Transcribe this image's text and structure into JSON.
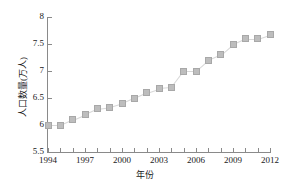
{
  "chart_data": {
    "type": "line",
    "title": "",
    "xlabel": "年份",
    "ylabel": "人口数量(万人)",
    "xlim": [
      1994,
      2012
    ],
    "ylim": [
      5.5,
      8
    ],
    "yticks": [
      5.5,
      6,
      6.5,
      7,
      7.5,
      8
    ],
    "ytick_labels": [
      "5.5",
      "6",
      "6.5",
      "7",
      "7.5",
      "8"
    ],
    "xticks": [
      1994,
      1997,
      2000,
      2003,
      2006,
      2009,
      2012
    ],
    "xtick_labels": [
      "1994",
      "1997",
      "2000",
      "2003",
      "2006",
      "2009",
      "2012"
    ],
    "minor_xticks_every": 1,
    "grid": false,
    "legend": null,
    "marker": "square",
    "marker_color": "#bdbdbd",
    "line_color": "#d8d8d8",
    "x": [
      1994,
      1995,
      1996,
      1997,
      1998,
      1999,
      2000,
      2001,
      2002,
      2003,
      2004,
      2005,
      2006,
      2007,
      2008,
      2009,
      2010,
      2011,
      2012
    ],
    "values": [
      6.0,
      6.0,
      6.1,
      6.2,
      6.3,
      6.33,
      6.4,
      6.5,
      6.6,
      6.68,
      6.7,
      7.0,
      7.0,
      7.2,
      7.3,
      7.5,
      7.6,
      7.6,
      7.68
    ],
    "series": [
      {
        "name": "人口数量",
        "values": [
          6.0,
          6.0,
          6.1,
          6.2,
          6.3,
          6.33,
          6.4,
          6.5,
          6.6,
          6.68,
          6.7,
          7.0,
          7.0,
          7.2,
          7.3,
          7.5,
          7.6,
          7.6,
          7.68
        ]
      }
    ]
  }
}
